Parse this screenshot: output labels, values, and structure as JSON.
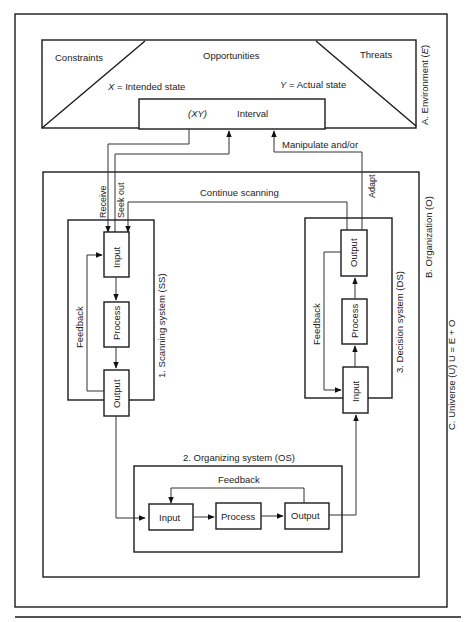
{
  "environment": {
    "label": "A. Environment (",
    "label_var": "E",
    "constraints": "Constraints",
    "opportunities": "Opportunities",
    "threats": "Threats",
    "intended": " =  Intended state",
    "intended_var": "X",
    "actual": " =  Actual state",
    "actual_var": "Y",
    "interval_var": "(XY)",
    "interval": "Interval"
  },
  "organization": {
    "label": "B. Organization (O)",
    "receive": "Receive",
    "seek_out": "Seek out",
    "continue_scanning": "Continue scanning",
    "manipulate": "Manipulate and/or",
    "adapt": "Adapt"
  },
  "universe": {
    "label": "C. Universe (U) U = E + O"
  },
  "scanning_system": {
    "label": "1. Scanning system (SS)",
    "feedback": "Feedback",
    "input": "Input",
    "process": "Process",
    "output": "Output"
  },
  "organizing_system": {
    "label": "2. Organizing system (OS)",
    "feedback": "Feedback",
    "input": "Input",
    "process": "Process",
    "output": "Output"
  },
  "decision_system": {
    "label": "3. Decision system (DS)",
    "feedback": "Feedback",
    "input": "Input",
    "process": "Process",
    "output": "Output"
  }
}
